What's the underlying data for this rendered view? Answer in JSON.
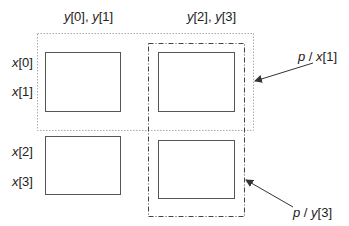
{
  "column_labels": [
    {
      "var1": "y",
      "idx1": "[0]",
      "sep": ", ",
      "var2": "y",
      "idx2": "[1]"
    },
    {
      "var1": "y",
      "idx1": "[2]",
      "sep": ", ",
      "var2": "y",
      "idx2": "[3]"
    }
  ],
  "row_labels": [
    {
      "var": "x",
      "idx": "[0]"
    },
    {
      "var": "x",
      "idx": "[1]"
    },
    {
      "var": "x",
      "idx": "[2]"
    },
    {
      "var": "x",
      "idx": "[3]"
    }
  ],
  "callouts": [
    {
      "p": "p",
      "sep": " / ",
      "var": "x",
      "idx": "[1]"
    },
    {
      "p": "p",
      "sep": " / ",
      "var": "y",
      "idx": "[3]"
    }
  ],
  "colors": {
    "box_stroke": "#555555",
    "dotted_stroke": "#aaaaaa",
    "dashdot_stroke": "#444444",
    "arrow": "#333333",
    "text": "#222222"
  }
}
